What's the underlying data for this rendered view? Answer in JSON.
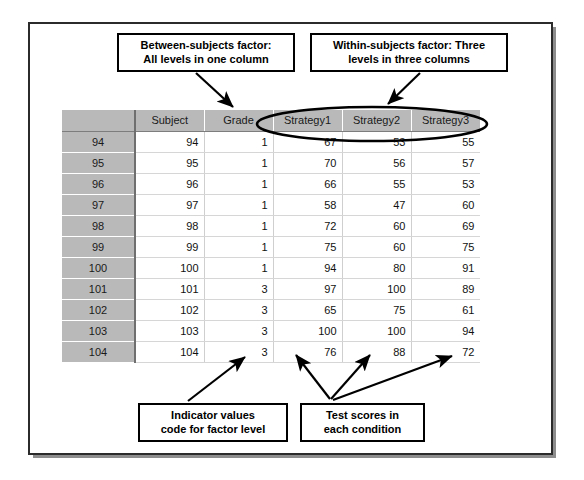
{
  "callouts": {
    "between_subjects": "Between-subjects factor:\nAll levels in one column",
    "within_subjects": "Within-subjects factor: Three\nlevels in three columns",
    "indicator_values": "Indicator values\ncode for factor level",
    "test_scores": "Test scores in\neach condition"
  },
  "spreadsheet": {
    "corner_label": "",
    "columns": [
      "Subject",
      "Grade",
      "Strategy1",
      "Strategy2",
      "Strategy3"
    ],
    "row_numbers": [
      "94",
      "95",
      "96",
      "97",
      "98",
      "99",
      "100",
      "101",
      "102",
      "103",
      "104",
      "105"
    ],
    "rows": [
      [
        "94",
        "1",
        "67",
        "53",
        "55"
      ],
      [
        "95",
        "1",
        "70",
        "56",
        "57"
      ],
      [
        "96",
        "1",
        "66",
        "55",
        "53"
      ],
      [
        "97",
        "1",
        "58",
        "47",
        "60"
      ],
      [
        "98",
        "1",
        "72",
        "60",
        "69"
      ],
      [
        "99",
        "1",
        "75",
        "60",
        "75"
      ],
      [
        "100",
        "1",
        "94",
        "80",
        "91"
      ],
      [
        "101",
        "3",
        "97",
        "100",
        "89"
      ],
      [
        "102",
        "3",
        "65",
        "75",
        "61"
      ],
      [
        "103",
        "3",
        "100",
        "100",
        "94"
      ],
      [
        "104",
        "3",
        "76",
        "88",
        "72"
      ],
      [
        "105",
        "3",
        "89",
        "100",
        "86"
      ]
    ]
  },
  "annotations": {
    "ellipse_target": "Strategy1-Strategy2-Strategy3 header group",
    "arrows": [
      "between-subjects-to-grade-column",
      "within-subjects-to-strategy-ellipse",
      "indicator-values-to-grade-cell",
      "test-scores-to-strategy1-cell",
      "test-scores-to-strategy2-cell",
      "test-scores-to-strategy3-cell"
    ]
  },
  "colors": {
    "header_gray": "#b9b9b9",
    "grid_line": "#cfcfcf",
    "frame_border": "#2b2b2b",
    "annotation_ink": "#000000"
  }
}
